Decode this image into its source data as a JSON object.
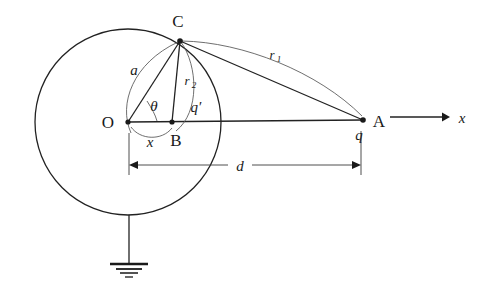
{
  "figure": {
    "background_color": "#ffffff",
    "line_color": "#222222",
    "arc_color": "#555555",
    "label_color": "#1a1a1a"
  },
  "labels": {
    "center_O": "O",
    "surface_point_C": "C",
    "image_point_B": "B",
    "charge_point_A": "A",
    "radius_a": "a",
    "distance_r1": "r",
    "distance_r1_sub": "1",
    "distance_r2": "r",
    "distance_r2_sub": "2",
    "angle_theta": "θ",
    "image_distance_x": "x",
    "image_charge_qprime": "q′",
    "real_charge_q": "q",
    "dimension_d": "d",
    "axis_x": "x"
  },
  "geometry": {
    "circle_center_x": 128,
    "circle_center_y": 122,
    "circle_radius": 93,
    "point_O": [
      128,
      122
    ],
    "point_B": [
      172,
      122
    ],
    "point_C": [
      180,
      41
    ],
    "point_A": [
      363,
      120
    ],
    "axis_arrow_start_x": 390,
    "axis_arrow_end_x": 447,
    "axis_arrow_y": 117,
    "dimension_line_y": 165,
    "dimension_left_x": 129,
    "dimension_right_x": 361,
    "ground_stem_top_y": 215,
    "ground_stem_bottom_y": 264,
    "ground_stem_x": 129
  },
  "label_positions": {
    "O": [
      108,
      128
    ],
    "C": [
      173,
      27
    ],
    "B": [
      168,
      145
    ],
    "A": [
      374,
      127
    ],
    "a": [
      132,
      74
    ],
    "r1": [
      272,
      59
    ],
    "r2": [
      186,
      85
    ],
    "theta": [
      152,
      110
    ],
    "x": [
      147,
      143
    ],
    "qprime": [
      192,
      112
    ],
    "q": [
      358,
      139
    ],
    "d": [
      240,
      170
    ],
    "axis_x": [
      456,
      122
    ]
  }
}
